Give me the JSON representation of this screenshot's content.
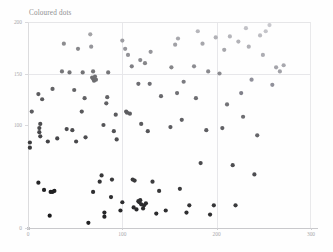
{
  "chart_data": {
    "type": "scatter",
    "title": "Coloured dots",
    "xlabel": "",
    "ylabel": "",
    "xlim": [
      0,
      300
    ],
    "ylim": [
      0,
      200
    ],
    "grid": true,
    "legend": "none",
    "xticks": [
      0,
      100,
      200,
      300
    ],
    "xticklabels": [
      "0",
      "100",
      "200",
      "300"
    ],
    "yticks": [
      0,
      100,
      150,
      200
    ],
    "yticklabels": [
      "0",
      "100",
      "150",
      "200"
    ],
    "gridlines_x": [
      100,
      200
    ],
    "gridlines_y": [
      150
    ],
    "marker": "circle",
    "marker_size": 2.1,
    "colormap": "dark-to-light-gray",
    "colormap_note": "points darken toward lower-left, lighten toward upper-right",
    "points": [
      {
        "x": 2,
        "y": 83,
        "c": "#3b3b3d"
      },
      {
        "x": 2,
        "y": 78,
        "c": "#3a3a3c"
      },
      {
        "x": 4,
        "y": 113,
        "c": "#5d5d60"
      },
      {
        "x": 11,
        "y": 130,
        "c": "#5c5c5f"
      },
      {
        "x": 12,
        "y": 97,
        "c": "#4a4a4c"
      },
      {
        "x": 12,
        "y": 93,
        "c": "#47474a"
      },
      {
        "x": 13,
        "y": 89,
        "c": "#454548"
      },
      {
        "x": 13,
        "y": 101,
        "c": "#4e4e51"
      },
      {
        "x": 15,
        "y": 125,
        "c": "#5a5a5d"
      },
      {
        "x": 11,
        "y": 44,
        "c": "#262628"
      },
      {
        "x": 17,
        "y": 37,
        "c": "#232325"
      },
      {
        "x": 24,
        "y": 35,
        "c": "#1f1f21"
      },
      {
        "x": 26,
        "y": 35,
        "c": "#1f1f21"
      },
      {
        "x": 28,
        "y": 36,
        "c": "#202022"
      },
      {
        "x": 23,
        "y": 12,
        "c": "#1b1b1d"
      },
      {
        "x": 26,
        "y": 135,
        "c": "#636366"
      },
      {
        "x": 31,
        "y": 87,
        "c": "#46464a"
      },
      {
        "x": 21,
        "y": 84,
        "c": "#434346"
      },
      {
        "x": 36,
        "y": 152,
        "c": "#77777a"
      },
      {
        "x": 41,
        "y": 96,
        "c": "#4d4d50"
      },
      {
        "x": 44,
        "y": 151,
        "c": "#747477"
      },
      {
        "x": 47,
        "y": 95,
        "c": "#4c4c4f"
      },
      {
        "x": 49,
        "y": 134,
        "c": "#636366"
      },
      {
        "x": 38,
        "y": 179,
        "c": "#8c8c8f"
      },
      {
        "x": 51,
        "y": 84,
        "c": "#48484b"
      },
      {
        "x": 57,
        "y": 113,
        "c": "#59595c"
      },
      {
        "x": 58,
        "y": 151,
        "c": "#737376"
      },
      {
        "x": 60,
        "y": 126,
        "c": "#626265"
      },
      {
        "x": 53,
        "y": 174,
        "c": "#88888b"
      },
      {
        "x": 61,
        "y": 88,
        "c": "#4e4e51"
      },
      {
        "x": 64,
        "y": 5,
        "c": "#222224"
      },
      {
        "x": 68,
        "y": 146,
        "c": "#6f6f72"
      },
      {
        "x": 69,
        "y": 145,
        "c": "#6e6e71"
      },
      {
        "x": 71,
        "y": 147,
        "c": "#707073"
      },
      {
        "x": 70,
        "y": 143,
        "c": "#6c6c6f"
      },
      {
        "x": 72,
        "y": 144,
        "c": "#6e6e71"
      },
      {
        "x": 69,
        "y": 35,
        "c": "#2e2e30"
      },
      {
        "x": 66,
        "y": 188,
        "c": "#a3a3a6"
      },
      {
        "x": 67,
        "y": 176,
        "c": "#95959a"
      },
      {
        "x": 69,
        "y": 152,
        "c": "#757578"
      },
      {
        "x": 78,
        "y": 51,
        "c": "#38383a"
      },
      {
        "x": 76,
        "y": 45,
        "c": "#333335"
      },
      {
        "x": 80,
        "y": 100,
        "c": "#545457"
      },
      {
        "x": 81,
        "y": 15,
        "c": "#262628"
      },
      {
        "x": 81,
        "y": 11,
        "c": "#242426"
      },
      {
        "x": 83,
        "y": 121,
        "c": "#616164"
      },
      {
        "x": 84,
        "y": 127,
        "c": "#646467"
      },
      {
        "x": 85,
        "y": 151,
        "c": "#767679"
      },
      {
        "x": 88,
        "y": 30,
        "c": "#2e2e30"
      },
      {
        "x": 89,
        "y": 47,
        "c": "#39393b"
      },
      {
        "x": 91,
        "y": 94,
        "c": "#535356"
      },
      {
        "x": 93,
        "y": 110,
        "c": "#5b5b5e"
      },
      {
        "x": 94,
        "y": 86,
        "c": "#4f4f52"
      },
      {
        "x": 98,
        "y": 17,
        "c": "#28282a"
      },
      {
        "x": 100,
        "y": 182,
        "c": "#9d9da2"
      },
      {
        "x": 103,
        "y": 174,
        "c": "#97979c"
      },
      {
        "x": 100,
        "y": 25,
        "c": "#2d2d2f"
      },
      {
        "x": 104,
        "y": 113,
        "c": "#5e5e61"
      },
      {
        "x": 105,
        "y": 112,
        "c": "#5d5d60"
      },
      {
        "x": 106,
        "y": 168,
        "c": "#929297"
      },
      {
        "x": 108,
        "y": 111,
        "c": "#5d5d60"
      },
      {
        "x": 110,
        "y": 157,
        "c": "#7f7f84"
      },
      {
        "x": 111,
        "y": 47,
        "c": "#3b3b3d"
      },
      {
        "x": 112,
        "y": 20,
        "c": "#2b2b2d"
      },
      {
        "x": 113,
        "y": 46,
        "c": "#3a3a3c"
      },
      {
        "x": 115,
        "y": 18,
        "c": "#2a2a2c"
      },
      {
        "x": 117,
        "y": 26,
        "c": "#2f2f31"
      },
      {
        "x": 118,
        "y": 25,
        "c": "#2e2e30"
      },
      {
        "x": 119,
        "y": 27,
        "c": "#303032"
      },
      {
        "x": 120,
        "y": 23,
        "c": "#2d2d2f"
      },
      {
        "x": 122,
        "y": 19,
        "c": "#2b2b2d"
      },
      {
        "x": 123,
        "y": 22,
        "c": "#2c2c2e"
      },
      {
        "x": 125,
        "y": 24,
        "c": "#2e2e30"
      },
      {
        "x": 120,
        "y": 101,
        "c": "#5a5a5d"
      },
      {
        "x": 117,
        "y": 140,
        "c": "#6d6d72"
      },
      {
        "x": 119,
        "y": 163,
        "c": "#8a8a8f"
      },
      {
        "x": 124,
        "y": 160,
        "c": "#868689"
      },
      {
        "x": 127,
        "y": 94,
        "c": "#565659"
      },
      {
        "x": 129,
        "y": 140,
        "c": "#6f6f74"
      },
      {
        "x": 130,
        "y": 171,
        "c": "#95959a"
      },
      {
        "x": 132,
        "y": 45,
        "c": "#3d3d3f"
      },
      {
        "x": 136,
        "y": 14,
        "c": "#2b2b2d"
      },
      {
        "x": 139,
        "y": 36,
        "c": "#383839"
      },
      {
        "x": 141,
        "y": 128,
        "c": "#69696d"
      },
      {
        "x": 146,
        "y": 17,
        "c": "#2e2e30"
      },
      {
        "x": 151,
        "y": 98,
        "c": "#5b5b5f"
      },
      {
        "x": 152,
        "y": 156,
        "c": "#868689"
      },
      {
        "x": 156,
        "y": 178,
        "c": "#a0a0a5"
      },
      {
        "x": 158,
        "y": 131,
        "c": "#717175"
      },
      {
        "x": 159,
        "y": 184,
        "c": "#a8a8ad"
      },
      {
        "x": 161,
        "y": 38,
        "c": "#3b3b3d"
      },
      {
        "x": 163,
        "y": 105,
        "c": "#616165"
      },
      {
        "x": 165,
        "y": 142,
        "c": "#7b7b80"
      },
      {
        "x": 168,
        "y": 15,
        "c": "#2e2e30"
      },
      {
        "x": 171,
        "y": 22,
        "c": "#333335"
      },
      {
        "x": 176,
        "y": 157,
        "c": "#8c8c91"
      },
      {
        "x": 178,
        "y": 126,
        "c": "#6f6f73"
      },
      {
        "x": 180,
        "y": 191,
        "c": "#b6b6bb"
      },
      {
        "x": 183,
        "y": 63,
        "c": "#4b4b4e"
      },
      {
        "x": 185,
        "y": 179,
        "c": "#a6a6ab"
      },
      {
        "x": 189,
        "y": 95,
        "c": "#5e5e62"
      },
      {
        "x": 191,
        "y": 152,
        "c": "#8a8a8f"
      },
      {
        "x": 193,
        "y": 13,
        "c": "#2f2f31"
      },
      {
        "x": 197,
        "y": 22,
        "c": "#363638"
      },
      {
        "x": 199,
        "y": 185,
        "c": "#b1b1b6"
      },
      {
        "x": 203,
        "y": 150,
        "c": "#8b8b90"
      },
      {
        "x": 206,
        "y": 97,
        "c": "#616165"
      },
      {
        "x": 208,
        "y": 173,
        "c": "#a6a6ab"
      },
      {
        "x": 211,
        "y": 120,
        "c": "#737377"
      },
      {
        "x": 214,
        "y": 186,
        "c": "#b5b5ba"
      },
      {
        "x": 217,
        "y": 61,
        "c": "#4e4e51"
      },
      {
        "x": 220,
        "y": 22,
        "c": "#393a3c"
      },
      {
        "x": 223,
        "y": 181,
        "c": "#b2b2b7"
      },
      {
        "x": 226,
        "y": 131,
        "c": "#80808a"
      },
      {
        "x": 228,
        "y": 108,
        "c": "#6e6e72"
      },
      {
        "x": 231,
        "y": 194,
        "c": "#c2c2c7"
      },
      {
        "x": 234,
        "y": 176,
        "c": "#b0b0b5"
      },
      {
        "x": 237,
        "y": 144,
        "c": "#90909a"
      },
      {
        "x": 240,
        "y": 52,
        "c": "#4d4d51"
      },
      {
        "x": 243,
        "y": 90,
        "c": "#66666a"
      },
      {
        "x": 246,
        "y": 187,
        "c": "#bcbcc1"
      },
      {
        "x": 249,
        "y": 168,
        "c": "#adadb3"
      },
      {
        "x": 252,
        "y": 191,
        "c": "#c4c4c9"
      },
      {
        "x": 256,
        "y": 197,
        "c": "#c8c8cd"
      },
      {
        "x": 259,
        "y": 139,
        "c": "#90909a"
      },
      {
        "x": 263,
        "y": 156,
        "c": "#a4a4aa"
      },
      {
        "x": 267,
        "y": 152,
        "c": "#a2a2a8"
      },
      {
        "x": 271,
        "y": 158,
        "c": "#a8a8ae"
      }
    ]
  }
}
